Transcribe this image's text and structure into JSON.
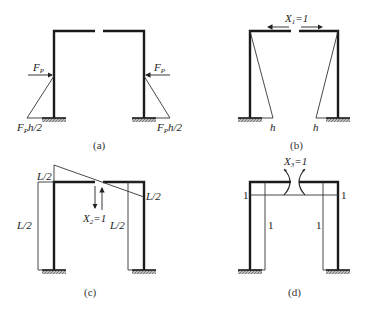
{
  "figure": {
    "panels": [
      {
        "id": "a",
        "caption": "(a)",
        "load_left": "F",
        "load_left_sub": "P",
        "load_right": "F",
        "load_right_sub": "P",
        "moment_left": "F",
        "moment_left_sub": "P",
        "moment_left_rest": "h/2",
        "moment_right": "F",
        "moment_right_sub": "P",
        "moment_right_rest": "h/2"
      },
      {
        "id": "b",
        "caption": "(b)",
        "unknown": "X",
        "unknown_sub": "1",
        "unknown_rest": "=1",
        "left_value": "h",
        "right_value": "h"
      },
      {
        "id": "c",
        "caption": "(c)",
        "unknown": "X",
        "unknown_sub": "2",
        "unknown_rest": "=1",
        "label_top_left": "L/2",
        "label_left_column": "L/2",
        "label_right_inner": "L/2",
        "label_right_end": "L/2"
      },
      {
        "id": "d",
        "caption": "(d)",
        "unknown": "X",
        "unknown_sub": "3",
        "unknown_rest": "=1",
        "label_left_top": "1",
        "label_right_top": "1",
        "label_left_column": "1",
        "label_right_column": "1"
      }
    ],
    "colors": {
      "member": "#1a1a1a",
      "diagram_line": "#333333",
      "hatch": "#777777"
    }
  }
}
